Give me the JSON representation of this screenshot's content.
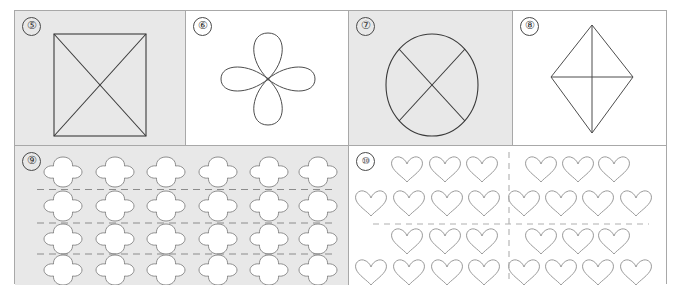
{
  "worksheet": {
    "title": "symmetry-and-grouping-worksheet",
    "background_color": "#ffffff",
    "border_color": "#a8a8a8",
    "shaded_panel_color": "#e8e8e8",
    "line_color": "#4d4d4d",
    "dash_color": "#8c8c8c"
  },
  "panels": [
    {
      "id": "panel-5",
      "marker": "⑤",
      "number": "5",
      "shaded": true,
      "figure": "square-with-both-diagonals",
      "description": "Rectangle/square outline crossed by two full diagonals forming an X"
    },
    {
      "id": "panel-6",
      "marker": "⑥",
      "number": "6",
      "shaded": false,
      "figure": "four-petal-flower",
      "description": "Four teardrop petals radiating from a central point: up, down, left, right"
    },
    {
      "id": "panel-7",
      "marker": "⑦",
      "number": "7",
      "shaded": true,
      "figure": "circle-with-two-diagonals",
      "description": "Circle outline with two crossing chords forming an X through the centre"
    },
    {
      "id": "panel-8",
      "marker": "⑧",
      "number": "8",
      "shaded": false,
      "figure": "kite-with-axes",
      "description": "Tall kite / rhombus outline with a vertical axis and a horizontal axis drawn inside"
    },
    {
      "id": "panel-9",
      "marker": "⑨",
      "number": "9",
      "shaded": true,
      "figure": "clover-grid",
      "description": "Grid of four-lobed clover shapes separated by horizontal dashed lines",
      "grid": {
        "rows": 4,
        "columns": 6,
        "total": 24,
        "shape": "clover"
      },
      "dashed_lines": {
        "orientation": "horizontal",
        "count": 3
      }
    },
    {
      "id": "panel-10",
      "marker": "⑩",
      "number": "10",
      "shaded": false,
      "figure": "heart-quadrants",
      "description": "Hearts arranged in four quadrants split by one vertical and one horizontal dashed line",
      "quadrants": [
        {
          "position": "top-left",
          "rows": [
            3,
            4
          ],
          "total": 7
        },
        {
          "position": "top-right",
          "rows": [
            3,
            4
          ],
          "total": 7
        },
        {
          "position": "bottom-left",
          "rows": [
            3,
            4
          ],
          "total": 7
        },
        {
          "position": "bottom-right",
          "rows": [
            3,
            4
          ],
          "total": 7
        }
      ],
      "shape": "heart",
      "total": 28,
      "dashed_lines": {
        "vertical": 1,
        "horizontal": 1
      }
    }
  ]
}
